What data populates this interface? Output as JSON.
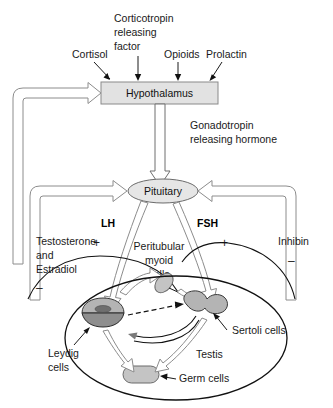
{
  "diagram": {
    "nodes": {
      "hypothalamus": "Hypothalamus",
      "pituitary": "Pituitary",
      "peritubular_myoid_cells": "Peritubular\nmyoid\ncells",
      "peritubular_line1": "Peritubular",
      "peritubular_line2": "myoid",
      "peritubular_line3": "cells",
      "leydig_line1": "Leydig",
      "leydig_line2": "cells",
      "sertoli": "Sertoli cells",
      "germ": "Germ cells",
      "testis": "Testis"
    },
    "inputs": {
      "cortisol": "Cortisol",
      "crf_line1": "Corticotropin",
      "crf_line2": "releasing",
      "crf_line3": "factor",
      "opioids": "Opioids",
      "prolactin": "Prolactin"
    },
    "hormones": {
      "gnrh_line1": "Gonadotropin",
      "gnrh_line2": "releasing hormone",
      "lh": "LH",
      "fsh": "FSH",
      "testosterone_line1": "Testosterone",
      "testosterone_line2": "and",
      "testosterone_line3": "Estradiol",
      "inhibin": "Inhibin"
    },
    "signs": {
      "lh_plus": "+",
      "fsh_plus": "+",
      "testosterone_minus": "–",
      "inhibin_minus": "–"
    },
    "colors": {
      "background": "#ffffff",
      "box_fill": "#e2e2e2",
      "ellipse_fill": "#e6e6e6",
      "cell_gray": "#b4b4b4",
      "outline": "#111111",
      "arrow_stroke": "#8c8c8c"
    }
  }
}
